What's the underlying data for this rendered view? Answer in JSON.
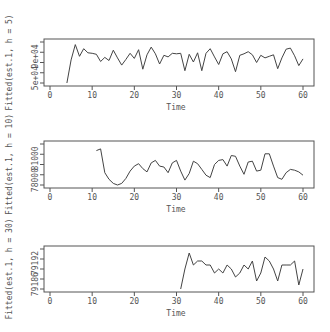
{
  "chart_data": [
    {
      "type": "line",
      "title": "",
      "xlabel": "Time",
      "ylabel": "Fitted(est.1, h = 5)",
      "xlim": [
        0,
        60
      ],
      "x_ticks": [
        "0",
        "10",
        "20",
        "30",
        "40",
        "50",
        "60"
      ],
      "y_ticks": [
        "5e+04",
        "9e+04"
      ],
      "ylim": [
        30000,
        110000
      ],
      "grid": false,
      "x": [
        4,
        5,
        6,
        7,
        8,
        9,
        10,
        11,
        12,
        13,
        14,
        15,
        16,
        17,
        18,
        19,
        20,
        21,
        22,
        23,
        24,
        25,
        26,
        27,
        28,
        29,
        30,
        31,
        32,
        33,
        34,
        35,
        36,
        37,
        38,
        39,
        40,
        41,
        42,
        43,
        44,
        45,
        46,
        47,
        48,
        49,
        50,
        51,
        52,
        53,
        54,
        55,
        56,
        57,
        58,
        59,
        60
      ],
      "values": [
        30000,
        75000,
        105000,
        82000,
        97000,
        89000,
        88000,
        86000,
        72000,
        80000,
        74000,
        94000,
        79000,
        65000,
        76000,
        88000,
        78000,
        95000,
        57000,
        85000,
        100000,
        87000,
        67000,
        84000,
        81000,
        88000,
        87000,
        88000,
        54000,
        86000,
        71000,
        89000,
        54000,
        88000,
        97000,
        81000,
        66000,
        87000,
        91000,
        77000,
        52000,
        84000,
        87000,
        91000,
        85000,
        70000,
        84000,
        79000,
        82000,
        85000,
        58000,
        79000,
        96000,
        98000,
        83000,
        64000,
        77000
      ]
    },
    {
      "type": "line",
      "title": "",
      "xlabel": "Time",
      "ylabel": "Fitted(est.1, h = 10)",
      "xlim": [
        0,
        60
      ],
      "x_ticks": [
        "0",
        "10",
        "20",
        "30",
        "40",
        "50",
        "60"
      ],
      "y_ticks": [
        "78000",
        "81000"
      ],
      "ylim": [
        77000,
        82000
      ],
      "grid": false,
      "x": [
        11,
        12,
        13,
        14,
        15,
        16,
        17,
        18,
        19,
        20,
        21,
        22,
        23,
        24,
        25,
        26,
        27,
        28,
        29,
        30,
        31,
        32,
        33,
        34,
        35,
        36,
        37,
        38,
        39,
        40,
        41,
        42,
        43,
        44,
        45,
        46,
        47,
        48,
        49,
        50,
        51,
        52,
        53,
        54,
        55,
        56,
        57,
        58,
        59,
        60
      ],
      "values": [
        81200,
        81400,
        78500,
        77700,
        77200,
        77000,
        77200,
        77800,
        78700,
        79300,
        79600,
        79000,
        78600,
        79700,
        80000,
        79300,
        79200,
        78500,
        79700,
        80000,
        78700,
        77600,
        78400,
        79900,
        79600,
        78900,
        78200,
        77900,
        79500,
        80000,
        80100,
        79300,
        80600,
        80500,
        79300,
        78300,
        79800,
        79900,
        78700,
        78800,
        80800,
        80800,
        79300,
        77900,
        77700,
        78500,
        78900,
        78800,
        78600,
        78200
      ]
    },
    {
      "type": "line",
      "title": "",
      "xlabel": "Time",
      "ylabel": "Fitted(est.1, h = 30)",
      "xlim": [
        0,
        60
      ],
      "x_ticks": [
        "0",
        "10",
        "20",
        "30",
        "40",
        "50",
        "60"
      ],
      "y_ticks": [
        "79186",
        "79192"
      ],
      "ylim": [
        79185,
        79195
      ],
      "grid": false,
      "x": [
        31,
        32,
        33,
        34,
        35,
        36,
        37,
        38,
        39,
        40,
        41,
        42,
        43,
        44,
        45,
        46,
        47,
        48,
        49,
        50,
        51,
        52,
        53,
        54,
        55,
        56,
        57,
        58,
        59,
        60
      ],
      "values": [
        79185,
        79190,
        79194,
        79191,
        79192,
        79192,
        79191,
        79191,
        79189,
        79190,
        79189,
        79191,
        79190,
        79188,
        79189,
        79191,
        79190,
        79192,
        79187,
        79189,
        79193,
        79192,
        79190,
        79187,
        79191,
        79191,
        79191,
        79192,
        79186,
        79190
      ]
    }
  ],
  "panels": [
    {
      "ylabel": "Fitted(est.1, h = 5)",
      "xlabel": "Time",
      "y_tick_labels": [
        "5e+04",
        "9e+04"
      ]
    },
    {
      "ylabel": "Fitted(est.1, h = 10)",
      "xlabel": "Time",
      "y_tick_labels": [
        "78000",
        "81000"
      ]
    },
    {
      "ylabel": "Fitted(est.1, h = 30)",
      "xlabel": "Time",
      "y_tick_labels": [
        "79186",
        "79192"
      ]
    }
  ],
  "x_tick_labels": [
    "0",
    "10",
    "20",
    "30",
    "40",
    "50",
    "60"
  ]
}
